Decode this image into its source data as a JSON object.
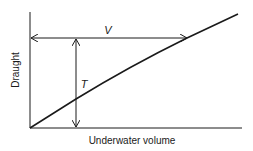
{
  "diagram": {
    "type": "draught-volume relationship",
    "x_axis_label": "Underwater volume",
    "y_axis_label": "Draught",
    "curve": "draught vs underwater volume (slightly concave line from origin)",
    "annotations": {
      "volume_symbol": "V",
      "draught_symbol": "T"
    },
    "colors": {
      "line": "#1a1a1a",
      "background": "#ffffff"
    }
  }
}
